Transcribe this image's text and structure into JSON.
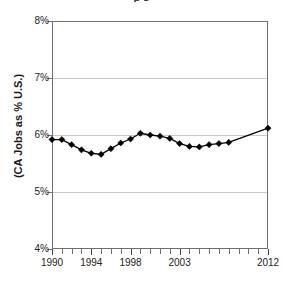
{
  "chart_data": {
    "type": "line",
    "title": "p         s",
    "xlabel": "",
    "ylabel": "(CA Jobs as % U.S.)",
    "ylim": [
      4,
      8
    ],
    "ytick_labels": [
      "8%",
      "7%",
      "6%",
      "5%",
      "4%"
    ],
    "ytick_values": [
      8,
      7,
      6,
      5,
      4
    ],
    "xlim": [
      1990,
      2012
    ],
    "xtick_labels": [
      "1990",
      "1994",
      "1998",
      "2003",
      "2012"
    ],
    "xtick_values": [
      1990,
      1994,
      1998,
      2003,
      2012
    ],
    "grid": true,
    "legend": "none",
    "marker": "diamond",
    "series": [
      {
        "name": "CA Jobs as % U.S.",
        "x": [
          1990,
          1991,
          1992,
          1993,
          1994,
          1995,
          1996,
          1997,
          1998,
          1999,
          2000,
          2001,
          2002,
          2003,
          2004,
          2005,
          2006,
          2007,
          2008,
          2012
        ],
        "values": [
          5.92,
          5.92,
          5.83,
          5.74,
          5.68,
          5.66,
          5.76,
          5.86,
          5.93,
          6.03,
          6.0,
          5.98,
          5.94,
          5.85,
          5.8,
          5.79,
          5.83,
          5.85,
          5.87,
          6.12
        ]
      }
    ]
  },
  "axis": {
    "y_title": "(CA Jobs as % U.S.)"
  }
}
